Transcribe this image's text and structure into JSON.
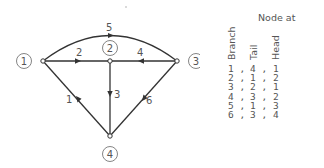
{
  "diagram": {
    "nodes": [
      {
        "id": "1",
        "label": "1",
        "x": 43,
        "y": 61
      },
      {
        "id": "2",
        "label": "2",
        "x": 110,
        "y": 61
      },
      {
        "id": "3",
        "label": "3",
        "x": 177,
        "y": 61
      },
      {
        "id": "4",
        "label": "4",
        "x": 110,
        "y": 136
      }
    ],
    "branches": [
      {
        "id": "1",
        "label": "1",
        "from": "4",
        "to": "1"
      },
      {
        "id": "2",
        "label": "2",
        "from": "1",
        "to": "2"
      },
      {
        "id": "3",
        "label": "3",
        "from": "2",
        "to": "4"
      },
      {
        "id": "4",
        "label": "4",
        "from": "3",
        "to": "2"
      },
      {
        "id": "5",
        "label": "5",
        "from": "1",
        "to": "3",
        "curved": true
      },
      {
        "id": "6",
        "label": "6",
        "from": "3",
        "to": "4"
      }
    ]
  },
  "table": {
    "header": "Node at",
    "columns": [
      "Branch",
      "Tail",
      "Head"
    ],
    "rows": [
      {
        "branch": "1 ,",
        "tail": "4 ,",
        "head": "1"
      },
      {
        "branch": "2 ,",
        "tail": "1 ,",
        "head": "2"
      },
      {
        "branch": "3 ,",
        "tail": "2 ,",
        "head": "1"
      },
      {
        "branch": "4 ,",
        "tail": "3 ,",
        "head": "2"
      },
      {
        "branch": "5 ,",
        "tail": "1 ,",
        "head": "3"
      },
      {
        "branch": "6 ,",
        "tail": "3 ,",
        "head": "4"
      }
    ]
  }
}
